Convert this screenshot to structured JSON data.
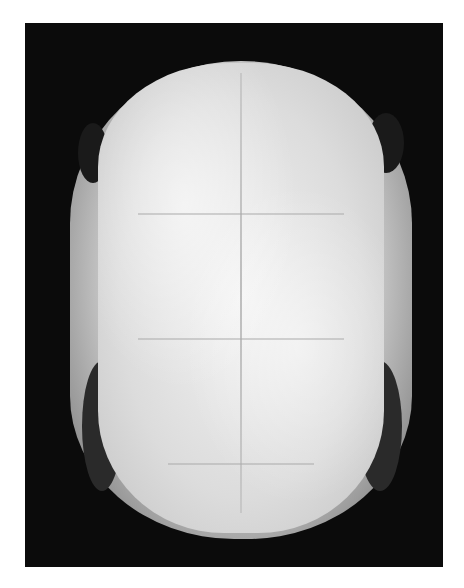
{
  "image": {
    "subject": "turtle shell specimen, dorsal view",
    "style": "grayscale photograph on black background",
    "colors": {
      "background": "#0b0b0b",
      "page": "#ffffff",
      "shell_light": "#e8e8e8",
      "shell_dark": "#555555"
    }
  }
}
